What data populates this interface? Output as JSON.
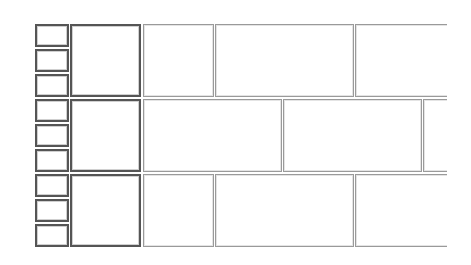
{
  "layout": {
    "description": "Brick-pattern grid of empty boxes",
    "colors": {
      "background": "#ffffff",
      "dark_border": "#555555",
      "light_border": "#9a9a9a"
    },
    "rows": [
      {
        "index": 0,
        "small_boxes": 3,
        "square": true,
        "cells": [
          "narrow",
          "wide",
          "wide-clipped"
        ]
      },
      {
        "index": 1,
        "small_boxes": 3,
        "square": true,
        "cells": [
          "wide",
          "wide",
          "narrow-clipped"
        ]
      },
      {
        "index": 2,
        "small_boxes": 3,
        "square": true,
        "cells": [
          "narrow",
          "wide",
          "wide-clipped"
        ]
      }
    ]
  }
}
